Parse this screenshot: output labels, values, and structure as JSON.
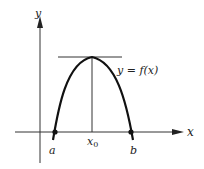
{
  "diagram": {
    "title": "",
    "axes": {
      "x_label": "x",
      "y_label": "y"
    },
    "curve": {
      "label": "y = f(x)",
      "shape": "parabola opening downward"
    },
    "points": {
      "a_label": "a",
      "b_label": "b",
      "x0_label": "x",
      "x0_subscript": "0"
    },
    "elements": [
      "horizontal tangent line at maximum",
      "vertical line from maximum to x-axis at x0",
      "dots marking a and b on x-axis"
    ],
    "colors": {
      "ink": "#222222",
      "background": "#ffffff"
    }
  }
}
